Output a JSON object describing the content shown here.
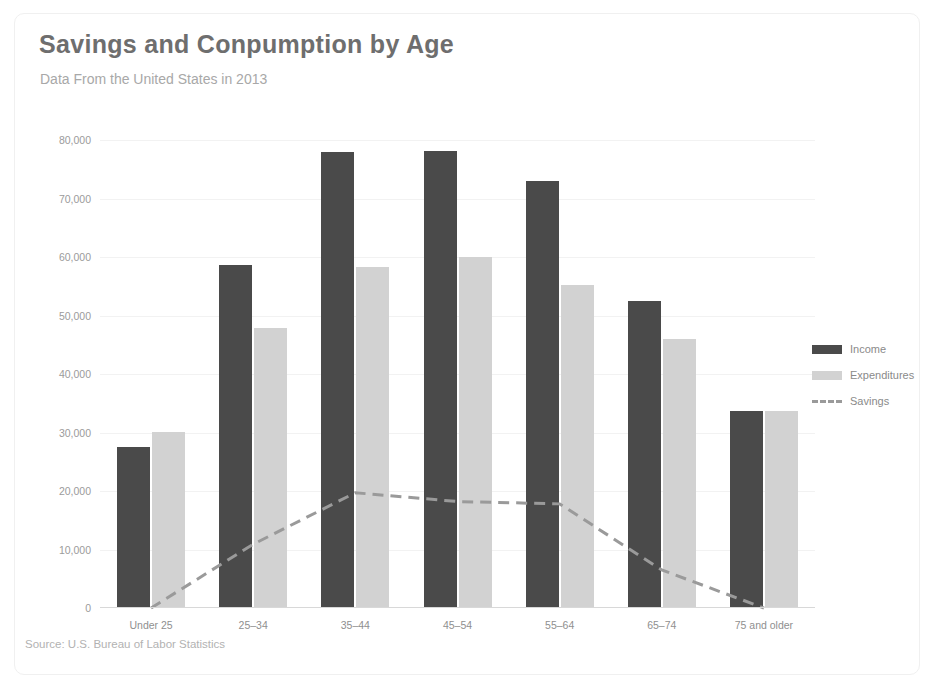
{
  "card": {
    "title": "Savings and Conpumption by Age",
    "subtitle": "Data From the United States in 2013",
    "source": "Source: U.S. Bureau of Labor Statistics"
  },
  "legend": {
    "position": "right",
    "items": [
      {
        "label": "Income",
        "type": "bar",
        "color": "#4a4a4a"
      },
      {
        "label": "Expenditures",
        "type": "bar",
        "color": "#d2d2d2"
      },
      {
        "label": "Savings",
        "type": "dashed-line",
        "color": "#9a9a9a"
      }
    ]
  },
  "chart_data": {
    "type": "bar",
    "title": "Savings and Conpumption by Age",
    "subtitle": "Data From the United States in 2013",
    "xlabel": "",
    "ylabel": "",
    "categories": [
      "Under 25",
      "25–34",
      "35–44",
      "45–54",
      "55–64",
      "65–74",
      "75 and older"
    ],
    "series": [
      {
        "name": "Income",
        "type": "bar",
        "color": "#4a4a4a",
        "values": [
          27500,
          58700,
          78000,
          78200,
          73000,
          52500,
          33600
        ]
      },
      {
        "name": "Expenditures",
        "type": "bar",
        "color": "#d2d2d2",
        "values": [
          30100,
          47800,
          58300,
          60000,
          55200,
          46000,
          33700
        ]
      },
      {
        "name": "Savings",
        "type": "line",
        "style": "dashed",
        "color": "#9a9a9a",
        "values": [
          -2600,
          10900,
          19700,
          18200,
          17800,
          6500,
          -100
        ]
      }
    ],
    "ylim": [
      0,
      80000
    ],
    "ytick_values": [
      0,
      10000,
      20000,
      30000,
      40000,
      50000,
      60000,
      70000,
      80000
    ],
    "ytick_labels": [
      "0",
      "10,000",
      "20,000",
      "30,000",
      "40,000",
      "50,000",
      "60,000",
      "70,000",
      "80,000"
    ],
    "grid": true,
    "legend_position": "right"
  }
}
